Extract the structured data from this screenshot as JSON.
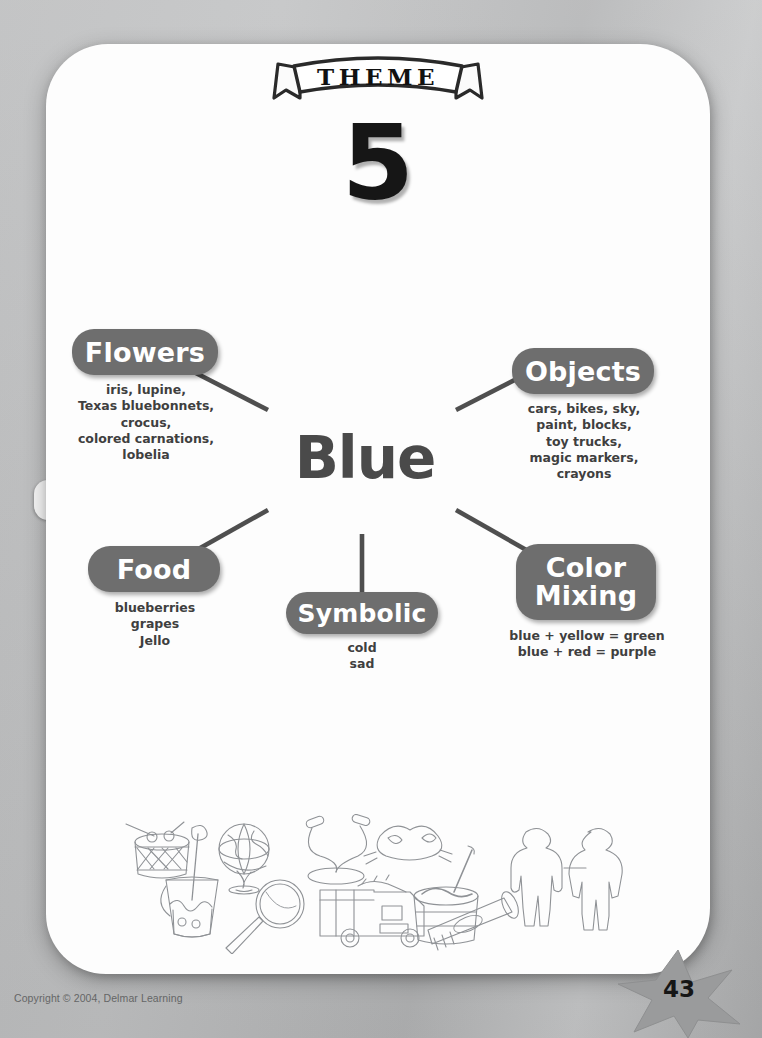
{
  "document": {
    "banner_label": "THEME",
    "theme_number": "5",
    "center_topic": "Blue",
    "copyright": "Copyright © 2004, Delmar Learning",
    "page_number": "43"
  },
  "colors": {
    "pill_fill": "#6e6e6e",
    "pill_text": "#ffffff",
    "center_text": "#4a4a4a",
    "item_text": "#3f3f3f",
    "connector": "#4f4f4f",
    "page_background": "#fdfdfd",
    "sheet_background": "#bdbebf",
    "star_fill": "#9a9b9c",
    "number_ink": "#161616"
  },
  "mind_map": {
    "center": "Blue",
    "branches": [
      {
        "id": "flowers",
        "label": "Flowers",
        "items": "iris, lupine,\nTexas bluebonnets,\ncrocus,\ncolored carnations,\nlobelia"
      },
      {
        "id": "objects",
        "label": "Objects",
        "items": "cars, bikes, sky,\npaint, blocks,\ntoy trucks,\nmagic markers,\ncrayons"
      },
      {
        "id": "food",
        "label": "Food",
        "items": "blueberries\ngrapes\nJello"
      },
      {
        "id": "symbolic",
        "label": "Symbolic",
        "items": "cold\nsad"
      },
      {
        "id": "color-mixing",
        "label": "Color\nMixing",
        "items": "blue + yellow = green\nblue + red = purple"
      }
    ]
  },
  "illustrations": [
    "drum-icon",
    "globe-icon",
    "jump-rope-icon",
    "sand-bucket-icon",
    "magnifying-glass-icon",
    "cat-mask-icon",
    "fire-truck-icon",
    "paint-bucket-icon",
    "paper-dolls-icon",
    "glue-stick-icon"
  ]
}
